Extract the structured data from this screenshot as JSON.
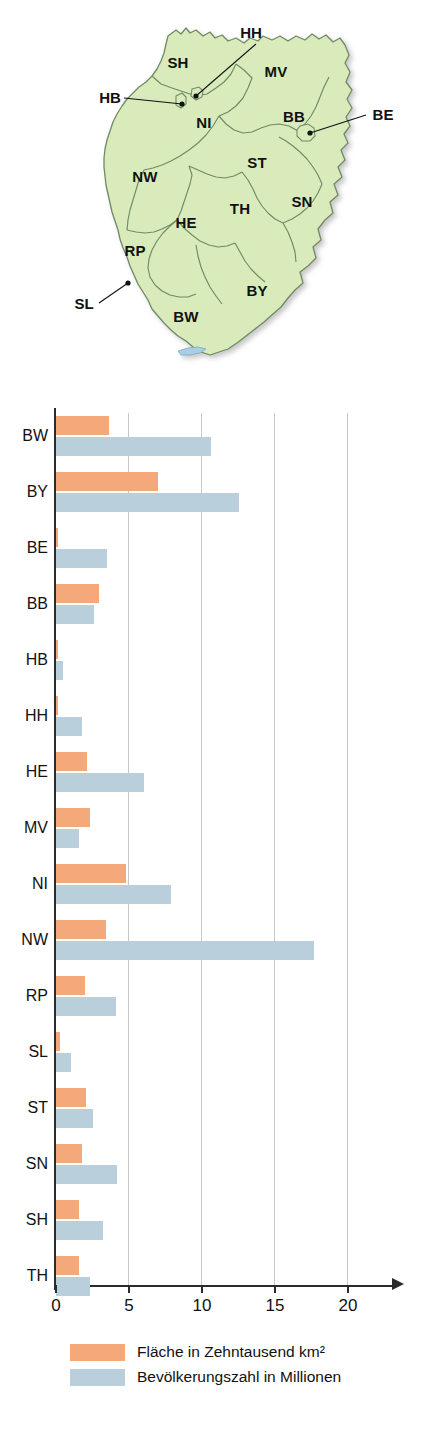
{
  "map": {
    "title": "Karte der deutschen Bundesländer",
    "fill_color": "#d9ebba",
    "border_color": "#7d9a72",
    "labels": [
      {
        "id": "SH",
        "text": "SH",
        "x": 178,
        "y": 68
      },
      {
        "id": "MV",
        "text": "MV",
        "x": 276,
        "y": 77
      },
      {
        "id": "NI",
        "text": "NI",
        "x": 204,
        "y": 128
      },
      {
        "id": "BB",
        "text": "BB",
        "x": 294,
        "y": 122
      },
      {
        "id": "NW",
        "text": "NW",
        "x": 145,
        "y": 182
      },
      {
        "id": "ST",
        "text": "ST",
        "x": 257,
        "y": 168
      },
      {
        "id": "HE",
        "text": "HE",
        "x": 186,
        "y": 228
      },
      {
        "id": "TH",
        "text": "TH",
        "x": 240,
        "y": 214
      },
      {
        "id": "SN",
        "text": "SN",
        "x": 302,
        "y": 207
      },
      {
        "id": "RP",
        "text": "RP",
        "x": 135,
        "y": 256
      },
      {
        "id": "BW",
        "text": "BW",
        "x": 186,
        "y": 322
      },
      {
        "id": "BY",
        "text": "BY",
        "x": 257,
        "y": 296
      }
    ],
    "callouts": [
      {
        "id": "HH",
        "text": "HH",
        "label_x": 251,
        "label_y": 38,
        "x1": 256,
        "y1": 44,
        "x2": 196,
        "y2": 96
      },
      {
        "id": "HB",
        "text": "HB",
        "label_x": 98,
        "label_y": 101,
        "x1": 124,
        "y1": 98,
        "x2": 182,
        "y2": 104
      },
      {
        "id": "BE",
        "text": "BE",
        "label_x": 369,
        "label_y": 118,
        "x1": 366,
        "y1": 115,
        "x2": 310,
        "y2": 132
      },
      {
        "id": "SL",
        "text": "SL",
        "label_x": 78,
        "label_y": 307,
        "x1": 99,
        "y1": 303,
        "x2": 128,
        "y2": 283
      }
    ]
  },
  "chart_data": {
    "type": "bar",
    "orientation": "horizontal",
    "title": "",
    "xlabel": "",
    "ylabel": "",
    "xlim": [
      0,
      23.5
    ],
    "xticks": [
      0,
      5,
      10,
      15,
      20
    ],
    "xticklabels": [
      "0",
      "5",
      "10",
      "15",
      "20"
    ],
    "grid": true,
    "grid_axis": "x",
    "legend_position": "bottom",
    "categories": [
      "BW",
      "BY",
      "BE",
      "BB",
      "HB",
      "HH",
      "HE",
      "MV",
      "NI",
      "NW",
      "RP",
      "SL",
      "ST",
      "SN",
      "SH",
      "TH"
    ],
    "series": [
      {
        "name": "Fläche in Zehntausend km²",
        "key": "area",
        "color": "#f5a97b",
        "values": [
          3.6,
          7.0,
          0.09,
          2.95,
          0.04,
          0.08,
          2.1,
          2.3,
          4.8,
          3.4,
          2.0,
          0.26,
          2.05,
          1.8,
          1.6,
          1.6
        ]
      },
      {
        "name": "Bevölkerungszahl in Millionen",
        "key": "pop",
        "color": "#b9cfdc",
        "values": [
          10.6,
          12.5,
          3.5,
          2.6,
          0.5,
          1.8,
          6.0,
          1.6,
          7.9,
          17.7,
          4.1,
          1.0,
          2.5,
          4.2,
          3.2,
          2.3
        ]
      }
    ]
  },
  "legend": {
    "items": [
      {
        "label": "Fläche in Zehntausend km²",
        "color": "#f5a97b"
      },
      {
        "label": "Bevölkerungszahl in Millionen",
        "color": "#b9cfdc"
      }
    ]
  }
}
